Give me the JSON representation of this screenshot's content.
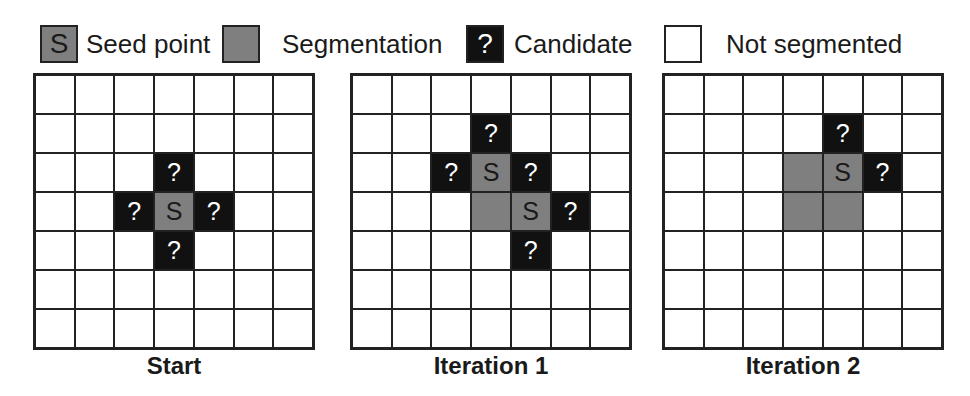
{
  "legend": {
    "items": [
      {
        "type": "seed",
        "glyph": "S",
        "label": "Seed point",
        "box_x": 40,
        "text_x": 86
      },
      {
        "type": "seg",
        "glyph": "",
        "label": "Segmentation",
        "box_x": 222,
        "text_x": 282
      },
      {
        "type": "cand",
        "glyph": "?",
        "label": "Candidate",
        "box_x": 466,
        "text_x": 514
      },
      {
        "type": "none",
        "glyph": "",
        "label": "Not segmented",
        "box_x": 664,
        "text_x": 726
      }
    ]
  },
  "colors": {
    "seed": "#7f7f7f",
    "segmentation": "#7f7f7f",
    "candidate": "#111111",
    "not_segmented": "#ffffff",
    "grid_line": "#222222"
  },
  "panels": [
    {
      "caption": "Start",
      "x": 33,
      "rows": [
        [
          "none",
          "none",
          "none",
          "none",
          "none",
          "none",
          "none"
        ],
        [
          "none",
          "none",
          "none",
          "none",
          "none",
          "none",
          "none"
        ],
        [
          "none",
          "none",
          "none",
          "cand",
          "none",
          "none",
          "none"
        ],
        [
          "none",
          "none",
          "cand",
          "seed",
          "cand",
          "none",
          "none"
        ],
        [
          "none",
          "none",
          "none",
          "cand",
          "none",
          "none",
          "none"
        ],
        [
          "none",
          "none",
          "none",
          "none",
          "none",
          "none",
          "none"
        ],
        [
          "none",
          "none",
          "none",
          "none",
          "none",
          "none",
          "none"
        ]
      ]
    },
    {
      "caption": "Iteration 1",
      "x": 350,
      "rows": [
        [
          "none",
          "none",
          "none",
          "none",
          "none",
          "none",
          "none"
        ],
        [
          "none",
          "none",
          "none",
          "cand",
          "none",
          "none",
          "none"
        ],
        [
          "none",
          "none",
          "cand",
          "seed",
          "cand",
          "none",
          "none"
        ],
        [
          "none",
          "none",
          "none",
          "seg",
          "seed",
          "cand",
          "none"
        ],
        [
          "none",
          "none",
          "none",
          "none",
          "cand",
          "none",
          "none"
        ],
        [
          "none",
          "none",
          "none",
          "none",
          "none",
          "none",
          "none"
        ],
        [
          "none",
          "none",
          "none",
          "none",
          "none",
          "none",
          "none"
        ]
      ]
    },
    {
      "caption": "Iteration 2",
      "x": 662,
      "rows": [
        [
          "none",
          "none",
          "none",
          "none",
          "none",
          "none",
          "none"
        ],
        [
          "none",
          "none",
          "none",
          "none",
          "cand",
          "none",
          "none"
        ],
        [
          "none",
          "none",
          "none",
          "seg",
          "seed",
          "cand",
          "none"
        ],
        [
          "none",
          "none",
          "none",
          "seg",
          "seg",
          "none",
          "none"
        ],
        [
          "none",
          "none",
          "none",
          "none",
          "none",
          "none",
          "none"
        ],
        [
          "none",
          "none",
          "none",
          "none",
          "none",
          "none",
          "none"
        ],
        [
          "none",
          "none",
          "none",
          "none",
          "none",
          "none",
          "none"
        ]
      ]
    }
  ],
  "glyphs": {
    "seed": "S",
    "cand": "?",
    "seg": "",
    "none": ""
  }
}
